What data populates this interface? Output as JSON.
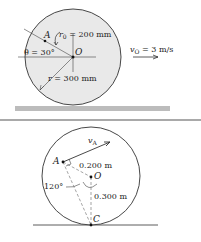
{
  "top_figure": {
    "point_A": "A",
    "point_O": "O",
    "r0_label": "r",
    "r0_sub": "0",
    "r0_value": " = 200 mm",
    "theta_label": "θ = 30°",
    "r_label": "r = 300 mm",
    "vo_label": "v",
    "vo_sub": "O",
    "vo_value": " = 3 m/s"
  },
  "bottom_figure": {
    "point_A": "A",
    "point_O": "O",
    "point_C": "C",
    "va_label": "v",
    "va_sub": "A",
    "dist_AO": "0.200 m",
    "dist_OC": "0.300 m",
    "angle": "120°"
  },
  "colors": {
    "line": "#333333",
    "circle_fill": "#e8e8e8",
    "ground": "#b8b8b8",
    "separator": "#555555"
  }
}
